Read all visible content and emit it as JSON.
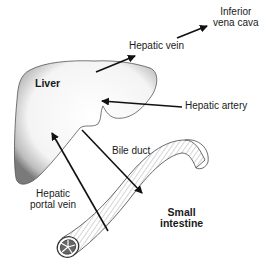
{
  "diagram": {
    "labels": {
      "inferior_vena_cava_line1": "Inferior",
      "inferior_vena_cava_line2": "vena cava",
      "hepatic_vein": "Hepatic vein",
      "liver": "Liver",
      "hepatic_artery": "Hepatic artery",
      "bile_duct": "Bile duct",
      "hepatic_portal_vein_line1": "Hepatic",
      "hepatic_portal_vein_line2": "portal vein",
      "small_intestine_line1": "Small",
      "small_intestine_line2": "intestine"
    },
    "nodes": [
      "Liver",
      "Small intestine",
      "Inferior vena cava"
    ],
    "edges": [
      {
        "from": "Liver",
        "to": "Inferior vena cava",
        "label": "Hepatic vein"
      },
      {
        "from": "Hepatic artery",
        "to": "Liver",
        "label": "Hepatic artery"
      },
      {
        "from": "Small intestine",
        "to": "Liver",
        "label": "Hepatic portal vein"
      },
      {
        "from": "Liver",
        "to": "Small intestine",
        "label": "Bile duct"
      }
    ]
  }
}
